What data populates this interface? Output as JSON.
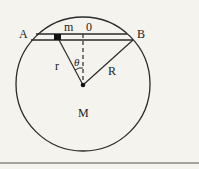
{
  "diagram": {
    "labels": {
      "A": "A",
      "B": "B",
      "m": "m",
      "O": "0",
      "r": "r",
      "R": "R",
      "theta": "θ",
      "M": "M"
    },
    "colors": {
      "background": "#f4f3ee",
      "stroke": "#2a2a2a"
    }
  }
}
